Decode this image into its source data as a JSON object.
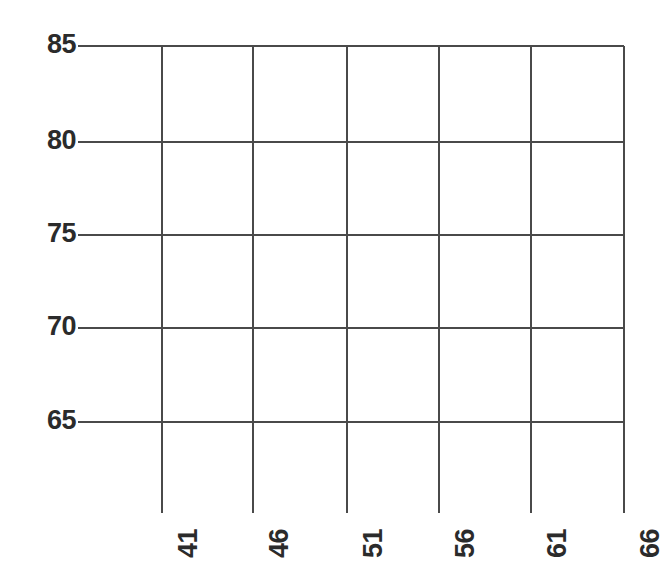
{
  "chart_data": {
    "type": "scatter",
    "title": "",
    "subtitle": "",
    "xlabel": "",
    "ylabel": "",
    "series": [],
    "x_ticks": [
      "41",
      "46",
      "51",
      "56",
      "61",
      "66"
    ],
    "y_ticks": [
      "85",
      "80",
      "75",
      "70",
      "65"
    ],
    "xlim": [
      41,
      66
    ],
    "ylim": [
      65,
      85
    ],
    "grid": true,
    "legend": "none",
    "annotations": [],
    "note": "Empty plot frame: gridlines and tick labels only, no data plotted"
  },
  "axes": {
    "y_axis": {
      "name": "y-axis",
      "ticks": [
        {
          "label": "85",
          "value": 85,
          "y": 46
        },
        {
          "label": "80",
          "value": 80,
          "y": 142
        },
        {
          "label": "75",
          "value": 75,
          "y": 235
        },
        {
          "label": "70",
          "value": 70,
          "y": 328
        },
        {
          "label": "65",
          "value": 65,
          "y": 422
        }
      ],
      "line_start_x": 78,
      "line_end_x": 624
    },
    "x_axis": {
      "name": "x-axis",
      "ticks": [
        {
          "label": "41",
          "value": 41,
          "x": 162
        },
        {
          "label": "46",
          "value": 46,
          "x": 253
        },
        {
          "label": "51",
          "value": 51,
          "x": 347
        },
        {
          "label": "56",
          "value": 56,
          "x": 439
        },
        {
          "label": "61",
          "value": 61,
          "x": 531
        },
        {
          "label": "66",
          "value": 66,
          "x": 624
        }
      ],
      "line_start_y": 46,
      "line_end_y": 513
    }
  },
  "style": {
    "background": "#ffffff",
    "grid_color": "#4a4a4a",
    "label_color": "#2b2b2b",
    "grid_width": 2
  }
}
